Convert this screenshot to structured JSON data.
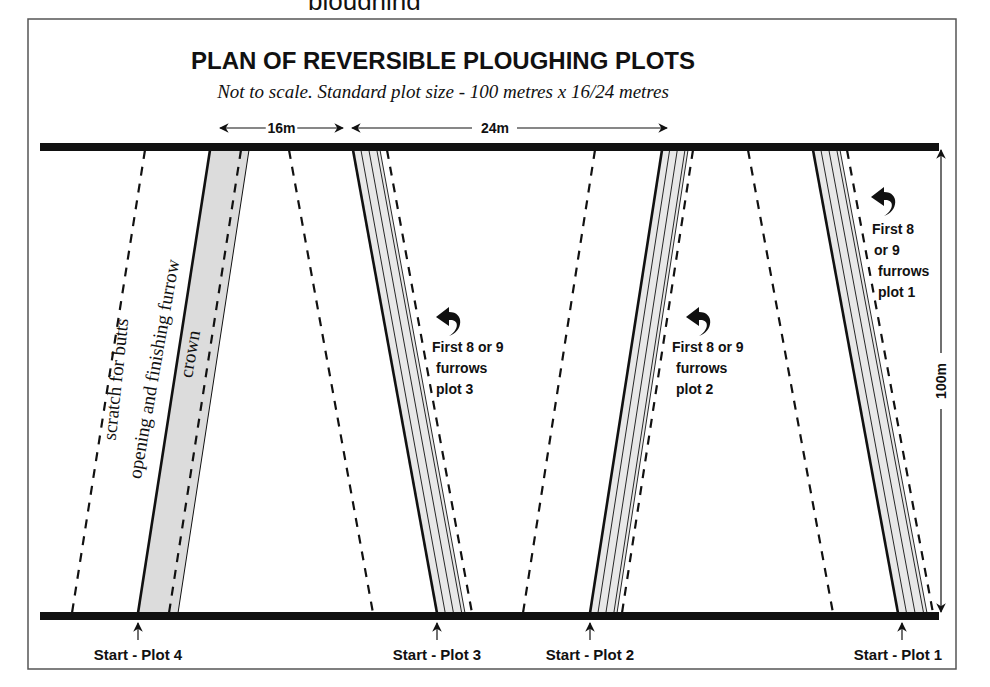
{
  "diagram": {
    "title": "PLAN OF REVERSIBLE PLOUGHING PLOTS",
    "subtitle": "Not to scale. Standard plot size - 100 metres x 16/24 metres",
    "top_cutoff_text": "ploughing",
    "colors": {
      "ink": "#111111",
      "band_fill": "#dcdcdc",
      "band_fill_light": "#e8e8e8",
      "frame": "#555555",
      "background": "#ffffff"
    },
    "frame": {
      "x": 28,
      "y": 19,
      "w": 928,
      "h": 650
    },
    "headland_top": {
      "x1": 40,
      "x2": 939,
      "y": 147
    },
    "headland_bottom": {
      "x1": 40,
      "x2": 939,
      "y": 616
    },
    "dimensions": {
      "width_16": {
        "label": "16m",
        "x1": 220,
        "x2": 343,
        "y": 128
      },
      "width_24": {
        "label": "24m",
        "x1": 352,
        "x2": 667,
        "y": 128
      },
      "length": {
        "label": "100m",
        "x": 941,
        "y1": 150,
        "y2": 612
      }
    },
    "dashed_lines": [
      {
        "name": "scratch-left",
        "top": 145,
        "bottom": 72
      },
      {
        "name": "plot4-right-boundary",
        "top": 289,
        "bottom": 373
      },
      {
        "name": "plot3-plot2-divider",
        "top": 595,
        "bottom": 523
      },
      {
        "name": "plot2-right-boundary",
        "top": 748,
        "bottom": 833
      }
    ],
    "plots": [
      {
        "id": "plot-4",
        "type": "crown",
        "band": {
          "top_left": 210,
          "top_right": 249,
          "bottom_left": 138,
          "bottom_right": 178
        },
        "dashed": {
          "top": 241,
          "bottom": 169
        },
        "start_x": 138,
        "start_label": "Start - Plot 4",
        "label_x": 138
      },
      {
        "id": "plot-3",
        "type": "furrows",
        "band": {
          "top_left": 353,
          "top_right": 380,
          "bottom_left": 437,
          "bottom_right": 465
        },
        "dashed": {
          "top": 387,
          "bottom": 472
        },
        "start_x": 437,
        "start_label": "Start - Plot 3",
        "label_x": 437,
        "note": {
          "lines": [
            "First 8 or 9",
            "furrows",
            "plot 3"
          ],
          "x": 432,
          "y": 352,
          "arrow_x": 447,
          "arrow_y": 318
        }
      },
      {
        "id": "plot-2",
        "type": "furrows",
        "band": {
          "top_left": 662,
          "top_right": 688,
          "bottom_left": 590,
          "bottom_right": 617
        },
        "dashed": {
          "top": 693,
          "bottom": 622
        },
        "start_x": 590,
        "start_label": "Start - Plot 2",
        "label_x": 590,
        "note": {
          "lines": [
            "First 8 or 9",
            "furrows",
            "plot 2"
          ],
          "x": 672,
          "y": 352,
          "arrow_x": 697,
          "arrow_y": 318
        }
      },
      {
        "id": "plot-1",
        "type": "furrows",
        "band": {
          "top_left": 813,
          "top_right": 840,
          "bottom_left": 898,
          "bottom_right": 927
        },
        "dashed": {
          "top": 847,
          "bottom": 933
        },
        "start_x": 902,
        "start_label": "Start - Plot 1",
        "label_x": 898,
        "note": {
          "lines": [
            "First 8",
            "or 9",
            "furrows",
            "plot 1"
          ],
          "x": 872,
          "y": 234,
          "arrow_x": 882,
          "arrow_y": 198
        }
      }
    ],
    "rotated_labels": [
      {
        "text": "scratch for butts",
        "cx": 122,
        "cy": 380,
        "angle": -84
      },
      {
        "text": "opening and finishing furrow",
        "cx": 160,
        "cy": 370,
        "angle": -80
      },
      {
        "text": "crown",
        "cx": 196,
        "cy": 355,
        "angle": -80
      }
    ]
  }
}
